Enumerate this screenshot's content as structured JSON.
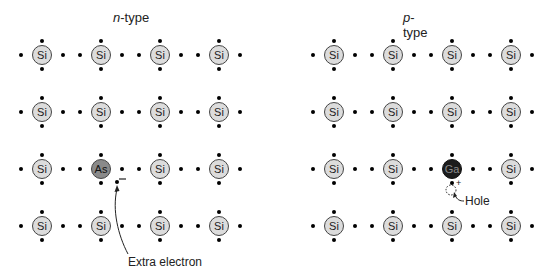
{
  "panels": [
    {
      "id": "n-type",
      "title_italic": "n",
      "title_rest": "-type",
      "origin_x": 42,
      "grid": [
        [
          "Si",
          "Si",
          "Si",
          "Si"
        ],
        [
          "Si",
          "Si",
          "Si",
          "Si"
        ],
        [
          "Si",
          "As",
          "Si",
          "Si"
        ],
        [
          "Si",
          "Si",
          "Si",
          "Si"
        ]
      ],
      "annotation": {
        "label": "Extra electron",
        "sign": "–"
      }
    },
    {
      "id": "p-type",
      "title_italic": "p",
      "title_rest": "-type",
      "origin_x": 334,
      "grid": [
        [
          "Si",
          "Si",
          "Si",
          "Si"
        ],
        [
          "Si",
          "Si",
          "Si",
          "Si"
        ],
        [
          "Si",
          "Si",
          "Ga",
          "Si"
        ],
        [
          "Si",
          "Si",
          "Si",
          "Si"
        ]
      ],
      "annotation": {
        "label": "Hole",
        "sign": "+"
      }
    }
  ],
  "layout": {
    "col_spacing": 59,
    "row_ys": [
      55,
      112,
      169,
      226
    ]
  },
  "colors": {
    "si_fill": "#dcdcdc",
    "as_fill": "#8a8a8a",
    "ga_fill": "#1c1c1c"
  }
}
